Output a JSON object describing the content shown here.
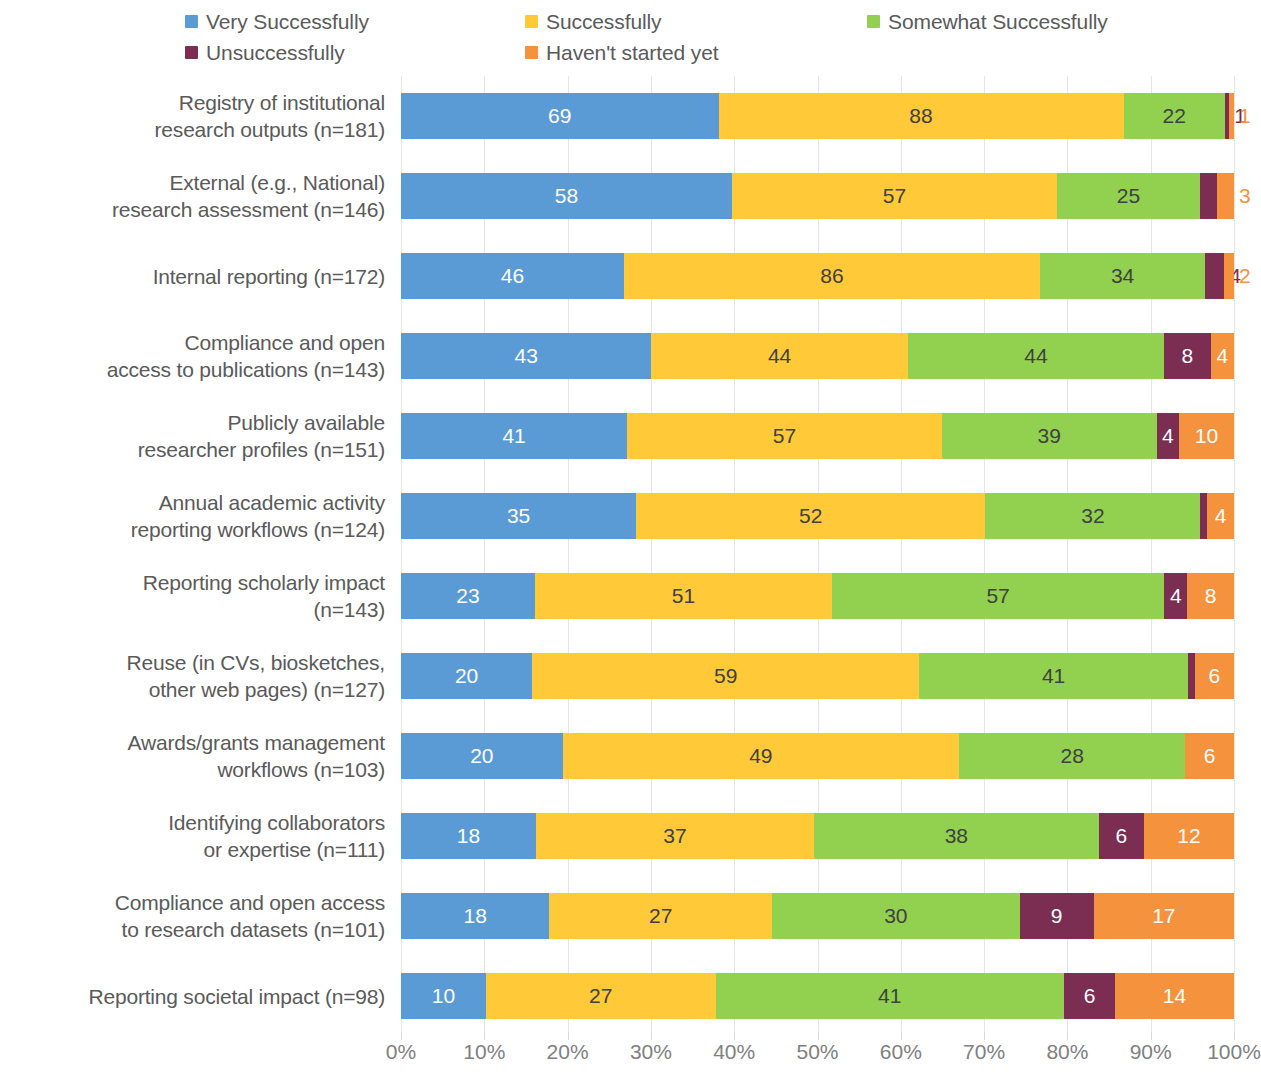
{
  "chart_data": {
    "type": "bar",
    "subtype": "horizontal-stacked-100pct",
    "title": "",
    "subtitle": "",
    "xlabel": "",
    "ylabel": "",
    "xlim": [
      0,
      100
    ],
    "xunit": "%",
    "grid": true,
    "legend_position": "top",
    "xticks": [
      "0%",
      "10%",
      "20%",
      "30%",
      "40%",
      "50%",
      "60%",
      "70%",
      "80%",
      "90%",
      "100%"
    ],
    "xtick_values": [
      0,
      10,
      20,
      30,
      40,
      50,
      60,
      70,
      80,
      90,
      100
    ],
    "series": [
      {
        "name": "Very Successfully",
        "color": "#5B9BD5",
        "values": [
          69,
          58,
          46,
          43,
          41,
          35,
          23,
          20,
          20,
          18,
          18,
          10
        ]
      },
      {
        "name": "Successfully",
        "color": "#FFC937",
        "values": [
          88,
          57,
          86,
          44,
          57,
          52,
          51,
          59,
          49,
          37,
          27,
          27
        ]
      },
      {
        "name": "Somewhat Successfully",
        "color": "#92D050",
        "values": [
          22,
          25,
          34,
          44,
          39,
          32,
          57,
          41,
          28,
          38,
          30,
          41
        ]
      },
      {
        "name": "Unsuccessfully",
        "color": "#7B2D52",
        "values": [
          1,
          3,
          4,
          8,
          4,
          1,
          4,
          1,
          0,
          6,
          9,
          6
        ]
      },
      {
        "name": "Haven't started yet",
        "color": "#F5923E",
        "values": [
          1,
          3,
          2,
          4,
          10,
          4,
          8,
          6,
          6,
          12,
          17,
          14
        ]
      }
    ],
    "categories": [
      "Registry of institutional research outputs (n=181)",
      "External (e.g., National) research assessment (n=146)",
      "Internal reporting (n=172)",
      "Compliance and open access to publications (n=143)",
      "Publicly available researcher profiles (n=151)",
      "Annual academic activity reporting workflows (n=124)",
      "Reporting scholarly impact (n=143)",
      "Reuse (in CVs, biosketches, other web pages) (n=127)",
      "Awards/grants management workflows (n=103)",
      "Identifying collaborators or expertise (n=111)",
      "Compliance and open access to research datasets (n=101)",
      "Reporting societal impact (n=98)"
    ],
    "category_lines": [
      [
        "Registry of institutional",
        "research outputs (n=181)"
      ],
      [
        "External (e.g., National)",
        "research assessment (n=146)"
      ],
      [
        "Internal reporting (n=172)"
      ],
      [
        "Compliance and open",
        "access to publications (n=143)"
      ],
      [
        "Publicly available",
        "researcher profiles (n=151)"
      ],
      [
        "Annual academic activity",
        "reporting workflows (n=124)"
      ],
      [
        "Reporting scholarly impact",
        "(n=143)"
      ],
      [
        "Reuse (in CVs, biosketches,",
        "other web pages) (n=127)"
      ],
      [
        "Awards/grants management",
        "workflows (n=103)"
      ],
      [
        "Identifying collaborators",
        "or expertise (n=111)"
      ],
      [
        "Compliance and open access",
        "to research datasets (n=101)"
      ],
      [
        "Reporting societal impact (n=98)"
      ]
    ],
    "totals": [
      181,
      146,
      172,
      143,
      151,
      124,
      143,
      127,
      103,
      111,
      101,
      98
    ]
  },
  "legend": {
    "rows": [
      [
        {
          "label": "Very Successfully",
          "color": "#5B9BD5"
        },
        {
          "label": "Successfully",
          "color": "#FFC937"
        },
        {
          "label": "Somewhat Successfully",
          "color": "#92D050"
        }
      ],
      [
        {
          "label": "Unsuccessfully",
          "color": "#7B2D52"
        },
        {
          "label": "Haven't started yet",
          "color": "#F5923E"
        }
      ]
    ]
  },
  "colors": {
    "very_successfully": "#5B9BD5",
    "successfully": "#FFC937",
    "somewhat_successfully": "#92D050",
    "unsuccessfully": "#7B2D52",
    "havent_started": "#F5923E",
    "gridline": "#E6E6E6",
    "text": "#5A5A5A",
    "axis_text": "#808080",
    "background": "#FFFFFF"
  }
}
